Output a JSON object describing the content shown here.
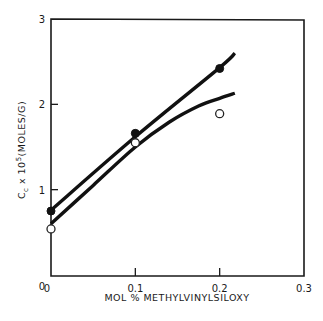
{
  "chart_data": {
    "type": "line",
    "title": "",
    "xlabel": "MOL % METHYLVINYLSILOXY",
    "ylabel": "C_c x 10^5 (MOLES/G)",
    "ylabel_parts": {
      "base": "C",
      "sub": "c",
      "mid": " x 10",
      "sup": "5",
      "unit": "(MOLES/G)"
    },
    "xlim": [
      0,
      0.3
    ],
    "ylim": [
      0,
      3
    ],
    "x_ticks": [
      0,
      0.1,
      0.2,
      0.3
    ],
    "x_tick_labels": [
      "0",
      "0.1",
      "0.2",
      "0.3"
    ],
    "y_ticks": [
      0,
      1,
      2,
      3
    ],
    "y_tick_labels": [
      "0",
      "1",
      "2",
      "3"
    ],
    "grid": false,
    "legend": null,
    "series": [
      {
        "name": "filled circles",
        "marker": "filled-circle",
        "x": [
          0,
          0.1,
          0.2
        ],
        "y": [
          0.75,
          1.66,
          2.42
        ],
        "fit_line": {
          "x": [
            0,
            0.1,
            0.2,
            0.218
          ],
          "y": [
            0.76,
            1.62,
            2.43,
            2.6
          ]
        }
      },
      {
        "name": "open circles",
        "marker": "open-circle",
        "x": [
          0,
          0.1,
          0.2
        ],
        "y": [
          0.54,
          1.55,
          1.89
        ],
        "fit_line": {
          "x": [
            0,
            0.05,
            0.1,
            0.14,
            0.175,
            0.2,
            0.218
          ],
          "y": [
            0.6,
            1.05,
            1.5,
            1.79,
            1.98,
            2.07,
            2.13
          ]
        }
      }
    ]
  }
}
